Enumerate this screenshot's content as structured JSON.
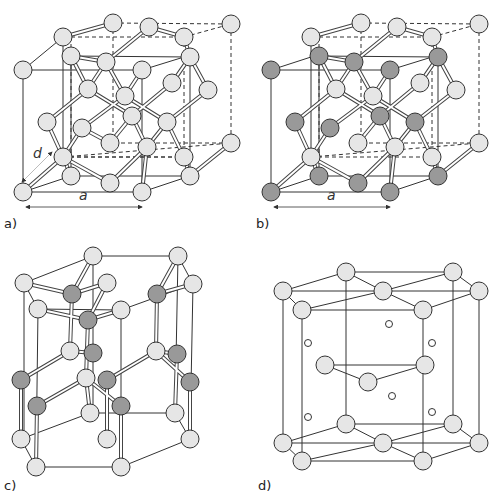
{
  "figure": {
    "panels": [
      {
        "id": "a",
        "label": "a)",
        "structure": "diamond cubic (single element)",
        "dims": [
          "a",
          "d"
        ]
      },
      {
        "id": "b",
        "label": "b)",
        "structure": "zinc blende (two elements)",
        "dims": [
          "a"
        ]
      },
      {
        "id": "c",
        "label": "c)",
        "structure": "wurtzite (hexagonal, two elements)"
      },
      {
        "id": "d",
        "label": "d)",
        "structure": "hexagonal close-packed with interstitial sites"
      }
    ],
    "colors": {
      "atom_light": "#e6e6e6",
      "atom_dark": "#999999",
      "stroke": "#333333",
      "background": "#ffffff"
    }
  },
  "labels": {
    "a": "a)",
    "b": "b)",
    "c": "c)",
    "d": "d)",
    "dim_a_panel_a": "a",
    "dim_d_panel_a": "d",
    "dim_a_panel_b": "a"
  }
}
